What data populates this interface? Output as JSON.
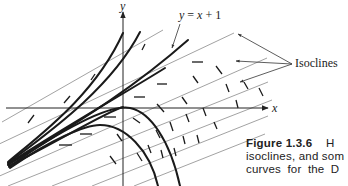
{
  "figure": {
    "axes": {
      "x_label": "x",
      "y_label": "y"
    },
    "annotations": {
      "line_label": "y = x + 1",
      "isoclines_label": "Isoclines"
    },
    "caption": {
      "number": "Figure 1.3.6",
      "line1_tail": "H",
      "line2": "isoclines, and som",
      "line3": "curves for the D"
    },
    "colors": {
      "curve": "#1a1a1a",
      "isocline": "#8a8a8a",
      "axis": "#222222"
    }
  }
}
